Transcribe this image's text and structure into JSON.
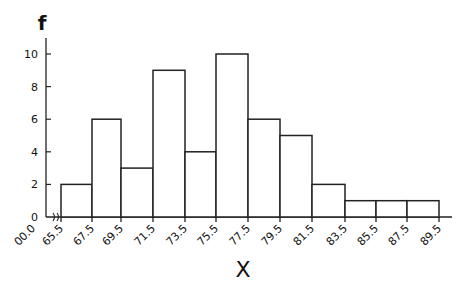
{
  "chart_data": {
    "type": "bar",
    "subtype": "histogram",
    "title": "",
    "xlabel": "X",
    "ylabel": "f",
    "bin_edges": [
      65.5,
      67.5,
      69.5,
      71.5,
      73.5,
      75.5,
      77.5,
      79.5,
      81.5,
      83.5,
      85.5,
      87.5,
      89.5
    ],
    "categories": [
      "65.5-67.5",
      "67.5-69.5",
      "69.5-71.5",
      "71.5-73.5",
      "73.5-75.5",
      "75.5-77.5",
      "77.5-79.5",
      "79.5-81.5",
      "81.5-83.5",
      "83.5-85.5",
      "85.5-87.5",
      "87.5-89.5"
    ],
    "values": [
      2,
      6,
      3,
      9,
      4,
      10,
      6,
      5,
      2,
      1,
      1,
      1
    ],
    "x_tick_labels": [
      "00.0",
      "65.5",
      "67.5",
      "69.5",
      "71.5",
      "73.5",
      "75.5",
      "77.5",
      "79.5",
      "81.5",
      "83.5",
      "85.5",
      "87.5",
      "89.5"
    ],
    "y_tick_labels": [
      "0",
      "2",
      "4",
      "6",
      "8",
      "10"
    ],
    "ylim": [
      0,
      11
    ],
    "grid": false,
    "axis_break": "x-axis break between 00.0 and 65.5"
  }
}
